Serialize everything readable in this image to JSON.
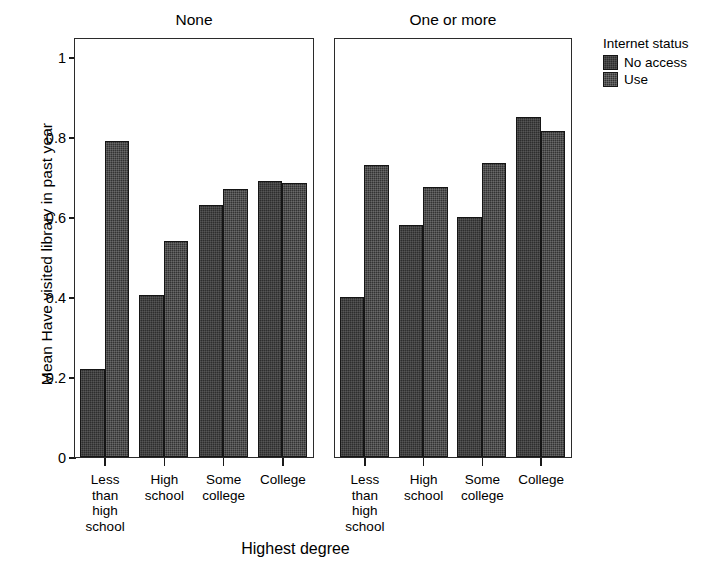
{
  "chart_data": {
    "type": "bar",
    "title": "",
    "xlabel": "Highest degree",
    "ylabel": "Mean Have visited library in past year",
    "ylim": [
      0,
      1.05
    ],
    "yticks": [
      0,
      0.2,
      0.4,
      0.6,
      0.8,
      1
    ],
    "ytick_labels": [
      "0",
      "0.2",
      "0.4",
      "0.6",
      "0.8",
      "1"
    ],
    "grid": false,
    "legend_position": "right",
    "legend_title": "Internet status",
    "categories": [
      "Less than high school",
      "High school",
      "Some college",
      "College"
    ],
    "category_labels": [
      "Less\nthan\nhigh\nschool",
      "High\nschool",
      "Some\ncollege",
      "College"
    ],
    "panel_variable": "Children in household",
    "panels": [
      {
        "label": "None",
        "series": [
          {
            "name": "No access",
            "values": [
              0.22,
              0.405,
              0.63,
              0.69
            ]
          },
          {
            "name": "Use",
            "values": [
              0.79,
              0.54,
              0.67,
              0.685
            ]
          }
        ]
      },
      {
        "label": "One or more",
        "series": [
          {
            "name": "No access",
            "values": [
              0.4,
              0.58,
              0.6,
              0.85
            ]
          },
          {
            "name": "Use",
            "values": [
              0.73,
              0.675,
              0.735,
              0.815
            ]
          }
        ]
      }
    ],
    "colors": {
      "no_access": "#2e2e2e",
      "use": "#333333",
      "axis": "#1a1a1a"
    }
  },
  "legend": {
    "title": "Internet status",
    "items": [
      {
        "label": "No access",
        "key": "no_access"
      },
      {
        "label": "Use",
        "key": "use"
      }
    ]
  },
  "axes": {
    "x_title": "Highest degree",
    "y_title": "Mean Have visited library in past year"
  }
}
